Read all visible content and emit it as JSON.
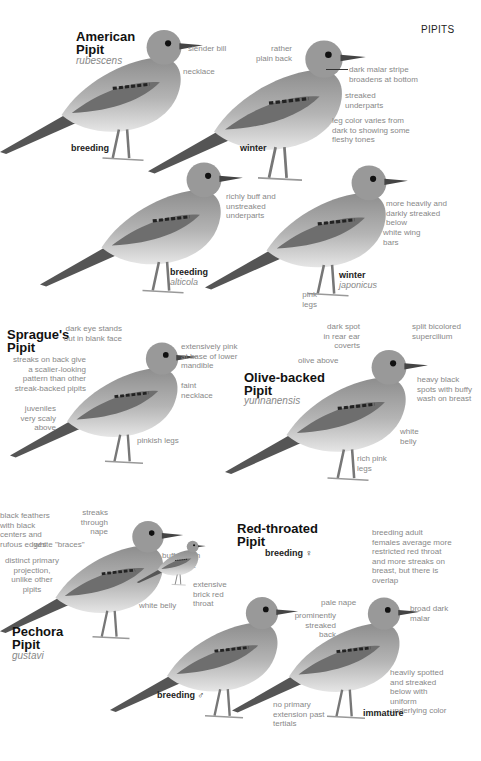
{
  "page": {
    "heading": "PIPITS"
  },
  "species": [
    {
      "name": "American Pipit",
      "name_lines": [
        "American",
        "Pipit"
      ],
      "subspecies": "rubescens",
      "plates": [
        {
          "label": "breeding",
          "sub": ""
        },
        {
          "label": "winter",
          "sub": ""
        },
        {
          "label": "breeding",
          "sub": "alticola"
        },
        {
          "label": "winter",
          "sub": "japonicus"
        }
      ],
      "notes": [
        "slender bill",
        "necklace",
        "rather plain back",
        "dark malar stripe broadens at bottom",
        "streaked underparts",
        "leg color varies from dark to showing some fleshy tones",
        "richly buff and unstreaked underparts",
        "more heavily and darkly streaked below",
        "white wing bars",
        "pink legs"
      ]
    },
    {
      "name": "Sprague's Pipit",
      "name_lines": [
        "Sprague's",
        "Pipit"
      ],
      "subspecies": "",
      "notes": [
        "dark eye stands out in blank face",
        "extensively pink at base of lower mandible",
        "streaks on back give a scalier-looking pattern than other streak-backed pipits",
        "faint necklace",
        "juveniles very scaly above",
        "pinkish legs"
      ]
    },
    {
      "name": "Olive-backed Pipit",
      "name_lines": [
        "Olive-backed",
        "Pipit"
      ],
      "subspecies": "yunnanensis",
      "notes": [
        "dark spot in rear ear coverts",
        "split bicolored supercilium",
        "olive above",
        "heavy black spots with buffy wash on breast",
        "white belly",
        "rich pink legs"
      ]
    },
    {
      "name": "Pechora Pipit",
      "name_lines": [
        "Pechora",
        "Pipit"
      ],
      "subspecies": "gustavi",
      "notes": [
        "black feathers with black centers and rufous edges",
        "streaks through nape",
        "white \"braces\"",
        "distinct primary projection, unlike other pipits",
        "buffy wash on breast",
        "white belly"
      ]
    },
    {
      "name": "Red-throated Pipit",
      "name_lines": [
        "Red-throated",
        "Pipit"
      ],
      "subspecies": "",
      "plates": [
        {
          "label": "breeding ♀",
          "sub": ""
        },
        {
          "label": "breeding ♂",
          "sub": ""
        },
        {
          "label": "immature",
          "sub": ""
        }
      ],
      "notes": [
        "breeding adult females average more restricted red throat and more streaks on breast, but there is overlap",
        "extensive brick red throat",
        "pale nape",
        "prominently streaked back",
        "broad dark malar",
        "heavily spotted and streaked below with uniform underlying color",
        "no primary extension past tertials"
      ]
    }
  ]
}
